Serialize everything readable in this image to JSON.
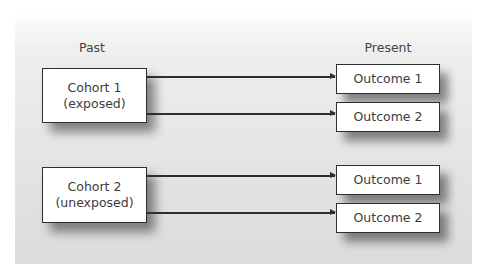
{
  "headings": {
    "past": "Past",
    "present": "Present"
  },
  "cohorts": [
    {
      "label_line1": "Cohort 1",
      "label_line2": "(exposed)",
      "outcomes": [
        "Outcome 1",
        "Outcome 2"
      ]
    },
    {
      "label_line1": "Cohort 2",
      "label_line2": "(unexposed)",
      "outcomes": [
        "Outcome 1",
        "Outcome 2"
      ]
    }
  ],
  "colors": {
    "box_border": "#2e2e2e",
    "box_fill": "#ffffff",
    "panel": "#e4e4e4",
    "text": "#3c3c3c"
  }
}
